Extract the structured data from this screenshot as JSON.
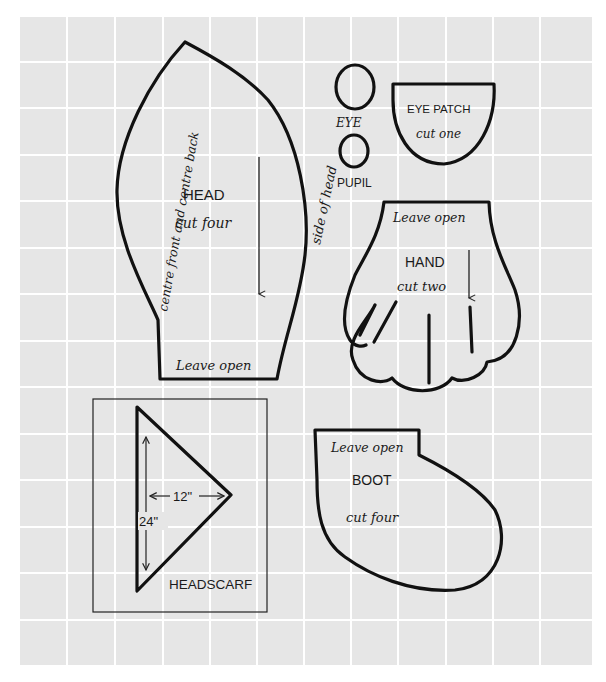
{
  "page": {
    "background_color": "#e6e6e6",
    "grid_color": "#ffffff",
    "line_color": "#111111"
  },
  "pieces": {
    "head": {
      "title": "HEAD",
      "instruction": "cut four",
      "left_edge_label": "centre front and centre back",
      "right_edge_label": "side of head",
      "opening_label": "Leave open"
    },
    "eye": {
      "title": "EYE"
    },
    "pupil": {
      "title": "PUPIL"
    },
    "eye_patch": {
      "title": "EYE PATCH",
      "instruction": "cut one"
    },
    "hand": {
      "title": "HAND",
      "instruction": "cut two",
      "opening_label": "Leave open"
    },
    "headscarf": {
      "title": "HEADSCARF",
      "width_dimension": "12\"",
      "height_dimension": "24\""
    },
    "boot": {
      "title": "BOOT",
      "instruction": "cut four",
      "opening_label": "Leave open"
    }
  }
}
